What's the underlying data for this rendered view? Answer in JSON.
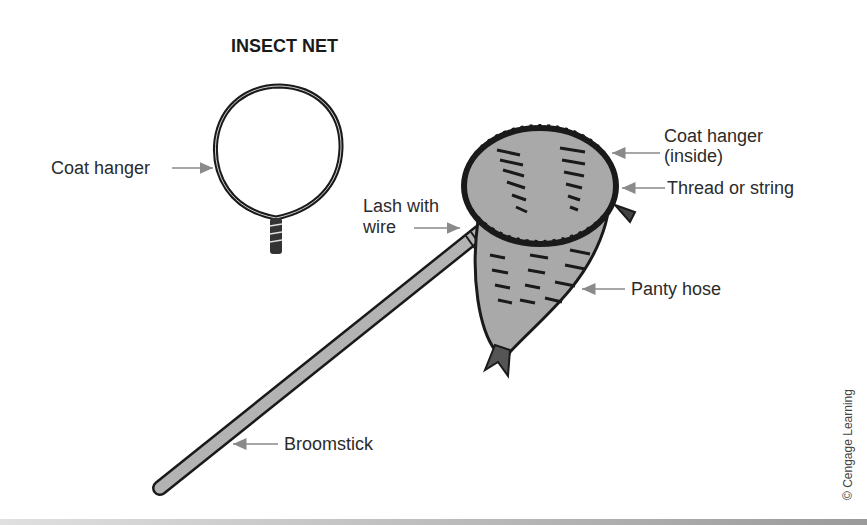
{
  "title": "INSECT NET",
  "labels": {
    "coat_hanger_left": "Coat hanger",
    "coat_hanger_inside_line1": "Coat hanger",
    "coat_hanger_inside_line2": "(inside)",
    "thread": "Thread or string",
    "lash_line1": "Lash with",
    "lash_line2": "wire",
    "panty_hose": "Panty hose",
    "broomstick": "Broomstick"
  },
  "credit": "© Cengage Learning",
  "colors": {
    "outline": "#1a1a1a",
    "fill_gray": "#a9a9a9",
    "arrow": "#8a8a8a",
    "text": "#2b2b2b"
  }
}
